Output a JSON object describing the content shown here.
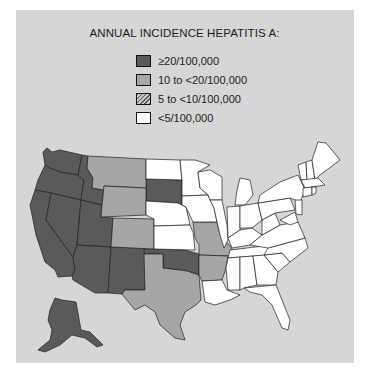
{
  "title": "ANNUAL INCIDENCE HEPATITIS A:",
  "legend": [
    {
      "label": "≥20/100,000",
      "color": "#5a5a5a",
      "pattern": "solid"
    },
    {
      "label": "10 to <20/100,000",
      "color": "#a6a6a6",
      "pattern": "solid"
    },
    {
      "label": "5 to <10/100,000",
      "color": "#9a9a9a",
      "pattern": "hatched"
    },
    {
      "label": "<5/100,000",
      "color": "#ffffff",
      "pattern": "solid"
    }
  ],
  "colors": {
    "background_panel": "#d6d6d6",
    "high": "#5a5a5a",
    "medium": "#a6a6a6",
    "low": "#ffffff",
    "border": "#1e1e1e"
  },
  "states": {
    "high": [
      "WA",
      "OR",
      "CA",
      "NV",
      "ID",
      "UT",
      "AZ",
      "NM",
      "SD",
      "OK",
      "AK"
    ],
    "medium": [
      "MT",
      "WY",
      "CO",
      "TX",
      "MO",
      "AR"
    ],
    "hatched": [],
    "low": [
      "ND",
      "NE",
      "KS",
      "MN",
      "IA",
      "WI",
      "IL",
      "MI",
      "IN",
      "OH",
      "KY",
      "TN",
      "MS",
      "AL",
      "GA",
      "FL",
      "SC",
      "NC",
      "VA",
      "WV",
      "PA",
      "NY",
      "VT",
      "NH",
      "ME",
      "MA",
      "CT",
      "RI",
      "NJ",
      "DE",
      "MD",
      "LA"
    ]
  }
}
